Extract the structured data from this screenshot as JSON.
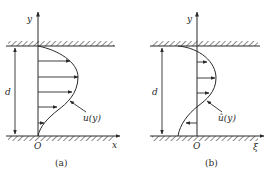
{
  "panels": [
    {
      "id": "a",
      "caption": "(a)",
      "y_axis_label": "y",
      "x_axis_label": "x",
      "origin_label": "O",
      "gap_label": "d",
      "profile_label": "u(y)"
    },
    {
      "id": "b",
      "caption": "(b)",
      "y_axis_label": "y",
      "x_axis_label": "ξ",
      "origin_label": "O",
      "gap_label": "d",
      "profile_label": "û(y)"
    }
  ],
  "colors": {
    "ink": "#2a2a2a",
    "background": "#ffffff"
  }
}
